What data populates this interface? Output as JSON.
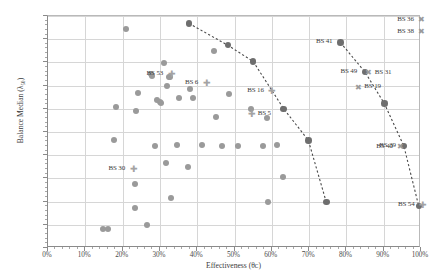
{
  "chart_data": {
    "type": "scatter",
    "title": "",
    "xlabel": "Effectiveness (θᴄ)",
    "ylabel": "Balance Median (λ₅₀)",
    "xlim": [
      0,
      100
    ],
    "ylim": [
      0,
      100
    ],
    "xticks": [
      "0%",
      "10%",
      "20%",
      "30%",
      "40%",
      "50%",
      "60%",
      "70%",
      "80%",
      "90%",
      "100%"
    ],
    "yticks": [
      "0%",
      "10%",
      "20%",
      "30%",
      "40%",
      "50%",
      "60%",
      "70%",
      "80%",
      "90%",
      "100%"
    ],
    "grid": true,
    "legend": "none",
    "marker_color": "#9a9a9a",
    "frontier_color": "#4a4a4a",
    "series": [
      {
        "name": "Solutions",
        "marker": "circle",
        "points": [
          {
            "x": 14.8,
            "y": 8.2
          },
          {
            "x": 16.0,
            "y": 8.2
          },
          {
            "x": 17.8,
            "y": 46.5
          },
          {
            "x": 18.2,
            "y": 60.8
          },
          {
            "x": 21.0,
            "y": 94.5
          },
          {
            "x": 23.2,
            "y": 17.2
          },
          {
            "x": 23.4,
            "y": 27.8
          },
          {
            "x": 23.6,
            "y": 59.2
          },
          {
            "x": 24.0,
            "y": 66.8
          },
          {
            "x": 26.6,
            "y": 9.8
          },
          {
            "x": 27.6,
            "y": 75.0
          },
          {
            "x": 28.0,
            "y": 74.0
          },
          {
            "x": 28.8,
            "y": 44.0
          },
          {
            "x": 29.2,
            "y": 64.0
          },
          {
            "x": 30.0,
            "y": 63.0
          },
          {
            "x": 30.4,
            "y": 62.5
          },
          {
            "x": 31.0,
            "y": 79.8
          },
          {
            "x": 31.6,
            "y": 36.5
          },
          {
            "x": 32.0,
            "y": 70.0
          },
          {
            "x": 32.4,
            "y": 73.5
          },
          {
            "x": 32.8,
            "y": 73.8
          },
          {
            "x": 33.0,
            "y": 21.6
          },
          {
            "x": 34.6,
            "y": 44.2
          },
          {
            "x": 35.0,
            "y": 64.5
          },
          {
            "x": 37.4,
            "y": 35.0
          },
          {
            "x": 38.0,
            "y": 68.5
          },
          {
            "x": 39.0,
            "y": 64.5
          },
          {
            "x": 41.2,
            "y": 44.2
          },
          {
            "x": 44.4,
            "y": 85.0
          },
          {
            "x": 45.0,
            "y": 56.6
          },
          {
            "x": 46.6,
            "y": 44.0
          },
          {
            "x": 48.6,
            "y": 66.2
          },
          {
            "x": 51.0,
            "y": 44.0
          },
          {
            "x": 54.4,
            "y": 59.8
          },
          {
            "x": 57.6,
            "y": 44.0
          },
          {
            "x": 58.8,
            "y": 56.2
          },
          {
            "x": 59.0,
            "y": 19.8
          },
          {
            "x": 61.4,
            "y": 44.5
          },
          {
            "x": 63.0,
            "y": 30.4
          }
        ]
      },
      {
        "name": "Frontier A",
        "marker": "circle-dark",
        "points": [
          {
            "x": 37.8,
            "y": 96.8
          },
          {
            "x": 48.2,
            "y": 87.4
          },
          {
            "x": 55.0,
            "y": 80.4
          },
          {
            "x": 63.2,
            "y": 60.0
          },
          {
            "x": 69.8,
            "y": 46.4
          },
          {
            "x": 74.6,
            "y": 19.8
          }
        ]
      },
      {
        "name": "Frontier B",
        "marker": "circle-dark",
        "points": [
          {
            "x": 78.4,
            "y": 88.6
          },
          {
            "x": 85.0,
            "y": 75.8
          },
          {
            "x": 90.2,
            "y": 62.2
          },
          {
            "x": 95.4,
            "y": 44.0
          },
          {
            "x": 99.4,
            "y": 18.0
          }
        ]
      }
    ],
    "cross_markers": [
      {
        "x": 100.2,
        "y": 98.4,
        "label": "BS 36"
      },
      {
        "x": 100.2,
        "y": 93.2,
        "label": "BS 38"
      },
      {
        "x": 86.0,
        "y": 75.6,
        "label": "BS 31"
      },
      {
        "x": 83.2,
        "y": 69.2,
        "label": "BS 19"
      },
      {
        "x": 94.6,
        "y": 43.6,
        "label": "BS 40"
      }
    ],
    "plus_markers": [
      {
        "x": 33.0,
        "y": 75.0,
        "label": "BS 53"
      },
      {
        "x": 42.4,
        "y": 71.0,
        "label": "BS 6"
      },
      {
        "x": 22.8,
        "y": 34.0,
        "label": "BS 30"
      },
      {
        "x": 60.0,
        "y": 67.6,
        "label": "BS 16"
      },
      {
        "x": 54.6,
        "y": 57.6,
        "label": "BS 5"
      },
      {
        "x": 100.4,
        "y": 18.4,
        "label": "BS 54"
      }
    ],
    "annotations": [
      {
        "label": "BS 36",
        "x": 100.2,
        "y": 98.4,
        "anchor": "left"
      },
      {
        "label": "BS 38",
        "x": 100.2,
        "y": 93.2,
        "anchor": "left"
      },
      {
        "label": "BS 41",
        "x": 78.4,
        "y": 88.6,
        "anchor": "left"
      },
      {
        "label": "BS 49",
        "x": 85.0,
        "y": 75.8,
        "anchor": "left"
      },
      {
        "label": "BS 31",
        "x": 86.0,
        "y": 75.6,
        "anchor": "right"
      },
      {
        "label": "BS 19",
        "x": 83.2,
        "y": 69.2,
        "anchor": "right"
      },
      {
        "label": "BS 39",
        "x": 95.4,
        "y": 44.0,
        "anchor": "left"
      },
      {
        "label": "BS 40",
        "x": 94.6,
        "y": 43.6,
        "anchor": "left"
      },
      {
        "label": "BS 54",
        "x": 100.4,
        "y": 18.4,
        "anchor": "left"
      },
      {
        "label": "BS 53",
        "x": 33.0,
        "y": 75.0,
        "anchor": "left"
      },
      {
        "label": "BS 6",
        "x": 42.4,
        "y": 71.0,
        "anchor": "left"
      },
      {
        "label": "BS 16",
        "x": 60.0,
        "y": 67.6,
        "anchor": "left"
      },
      {
        "label": "BS 5",
        "x": 54.6,
        "y": 57.6,
        "anchor": "right"
      },
      {
        "label": "BS 30",
        "x": 22.8,
        "y": 34.0,
        "anchor": "left"
      }
    ]
  }
}
